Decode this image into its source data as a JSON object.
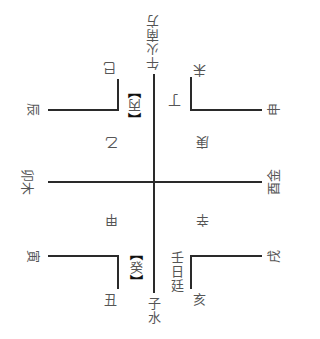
{
  "diagram": {
    "type": "bagua-stems-branches-cross",
    "line_color": "#2a2a2a",
    "text_color": "#555555",
    "top": {
      "direction": "午火南方"
    },
    "bottom": {
      "direction": "子水",
      "note": "壬日廷"
    },
    "left": {
      "direction": "卯木"
    },
    "right": {
      "direction": "酉金"
    },
    "stems": {
      "top_center": {
        "open": "【",
        "char": "丙",
        "close": "】"
      },
      "top_right": "丁",
      "upper_left": "乙",
      "upper_right": "庚",
      "lower_left": "甲",
      "lower_right": "辛",
      "bottom_center": {
        "open": "【",
        "char": "癸",
        "close": "】"
      }
    },
    "branches": {
      "si": "巳",
      "chen": "辰",
      "wei": "未",
      "shen": "申",
      "yin": "寅",
      "chou": "丑",
      "xu": "戌",
      "hai": "亥"
    }
  }
}
